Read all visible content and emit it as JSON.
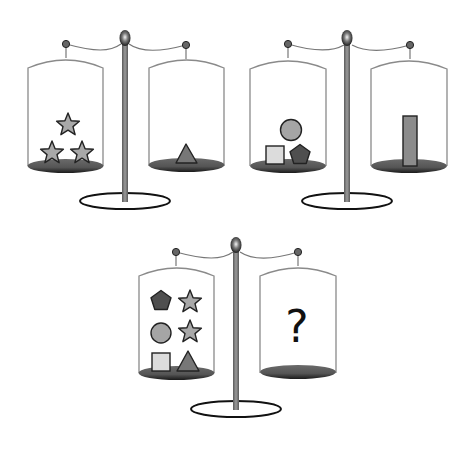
{
  "colors": {
    "background": "#ffffff",
    "outline": "#222222",
    "jar_outline": "#8a8a8a",
    "pole": "#7a7a7a",
    "pan": "#5e5e5e",
    "star": "#a8a8a8",
    "triangle": "#777777",
    "circle": "#a5a5a5",
    "square": "#dcdcdc",
    "pentagon": "#4f4f4f",
    "rectangle": "#8c8c8c"
  },
  "scales": [
    {
      "id": "scale-1",
      "left_pan": [
        "star",
        "star",
        "star"
      ],
      "right_pan": [
        "triangle"
      ],
      "balanced": true
    },
    {
      "id": "scale-2",
      "left_pan": [
        "circle",
        "square",
        "pentagon"
      ],
      "right_pan": [
        "rectangle"
      ],
      "balanced": true
    },
    {
      "id": "scale-3",
      "left_pan": [
        "pentagon",
        "star",
        "circle",
        "star",
        "square",
        "triangle"
      ],
      "right_pan": [],
      "balanced": true,
      "unknown_label": "?"
    }
  ]
}
